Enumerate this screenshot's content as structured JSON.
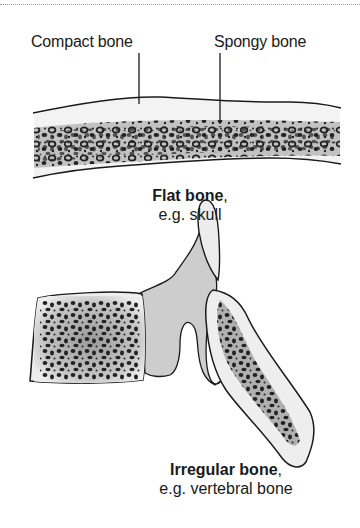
{
  "diagram": {
    "labels": {
      "compact_bone": "Compact bone",
      "spongy_bone": "Spongy bone"
    },
    "flat_bone": {
      "title": "Flat bone",
      "comma": ",",
      "example": "e.g. skull"
    },
    "irregular_bone": {
      "title": "Irregular bone",
      "comma": ",",
      "example": "e.g. vertebral bone"
    },
    "colors": {
      "outline": "#1a1a1a",
      "compact_fill": "#f2f2f2",
      "spongy_fill": "#b8b8b8",
      "process_fill": "#cfcfcf",
      "pores": "#222222"
    }
  }
}
